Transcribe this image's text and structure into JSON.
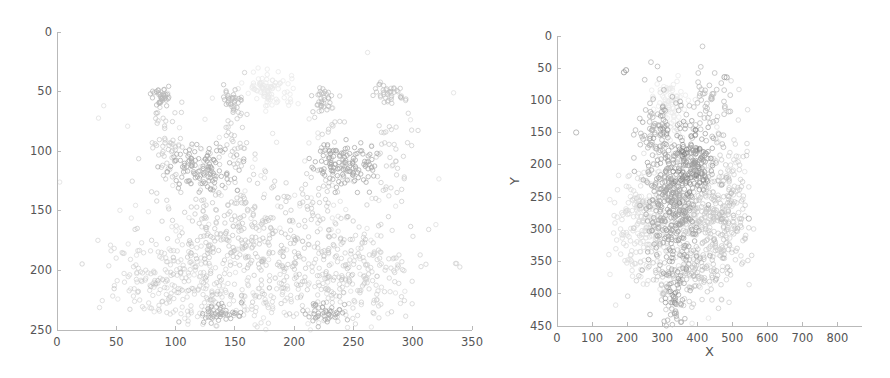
{
  "figure": {
    "background_color": "#ffffff",
    "axis_color": "#b9b9b9",
    "text_color": "#555555",
    "marker_shape": "circle-open"
  },
  "chart_data": [
    {
      "id": "left-panel",
      "type": "scatter",
      "title": "",
      "xlabel": "",
      "ylabel": "",
      "xlim": [
        0,
        350
      ],
      "ylim": [
        250,
        0
      ],
      "y_inverted": true,
      "grid": false,
      "legend": "none",
      "xticks": [
        0,
        50,
        100,
        150,
        200,
        250,
        300,
        350
      ],
      "xtick_labels": [
        "0",
        "50",
        "100",
        "150",
        "200",
        "250",
        "300",
        "350"
      ],
      "yticks": [
        0,
        50,
        100,
        150,
        200,
        250
      ],
      "ytick_labels": [
        "0",
        "50",
        "100",
        "150",
        "200",
        "250"
      ],
      "point_count": 2600,
      "clusters": [
        {
          "name": "dark-blob-left",
          "cx": 122,
          "cy": 113,
          "sx": 13,
          "sy": 9,
          "n": 210,
          "gray": "#6d6d6d",
          "alpha": 0.55,
          "r": 2.2
        },
        {
          "name": "dark-blob-right",
          "cx": 243,
          "cy": 112,
          "sx": 13,
          "sy": 9,
          "n": 210,
          "gray": "#666666",
          "alpha": 0.55,
          "r": 2.2
        },
        {
          "name": "light-top-cluster",
          "cx": 180,
          "cy": 49,
          "sx": 10,
          "sy": 7,
          "n": 150,
          "gray": "#d6d6d6",
          "alpha": 0.5,
          "r": 2.2
        },
        {
          "name": "spike-a-top",
          "cx": 88,
          "cy": 54,
          "sx": 4,
          "sy": 4,
          "n": 60,
          "gray": "#808080",
          "alpha": 0.55,
          "r": 2.2
        },
        {
          "name": "spike-b-top",
          "cx": 148,
          "cy": 57,
          "sx": 4,
          "sy": 5,
          "n": 55,
          "gray": "#8a8a8a",
          "alpha": 0.55,
          "r": 2.2
        },
        {
          "name": "spike-c-top",
          "cx": 224,
          "cy": 57,
          "sx": 5,
          "sy": 7,
          "n": 60,
          "gray": "#8f8f8f",
          "alpha": 0.55,
          "r": 2.2
        },
        {
          "name": "spike-d-top",
          "cx": 279,
          "cy": 51,
          "sx": 6,
          "sy": 5,
          "n": 55,
          "gray": "#949494",
          "alpha": 0.55,
          "r": 2.2
        },
        {
          "name": "spike-a-tail",
          "cx": 92,
          "cy": 95,
          "sx": 7,
          "sy": 25,
          "n": 90,
          "gray": "#9a9a9a",
          "alpha": 0.5,
          "r": 2.2
        },
        {
          "name": "spike-b-tail",
          "cx": 152,
          "cy": 95,
          "sx": 7,
          "sy": 25,
          "n": 75,
          "gray": "#9a9a9a",
          "alpha": 0.5,
          "r": 2.2
        },
        {
          "name": "spike-c-tail",
          "cx": 228,
          "cy": 95,
          "sx": 8,
          "sy": 26,
          "n": 80,
          "gray": "#9a9a9a",
          "alpha": 0.5,
          "r": 2.2
        },
        {
          "name": "spike-d-tail",
          "cx": 284,
          "cy": 95,
          "sx": 9,
          "sy": 28,
          "n": 80,
          "gray": "#9e9e9e",
          "alpha": 0.5,
          "r": 2.2
        },
        {
          "name": "center-dense-band",
          "cx": 168,
          "cy": 168,
          "sx": 42,
          "sy": 26,
          "n": 620,
          "gray": "#8d8d8d",
          "alpha": 0.45,
          "r": 2.2
        },
        {
          "name": "lower-left-lobe",
          "cx": 95,
          "cy": 205,
          "sx": 26,
          "sy": 19,
          "n": 330,
          "gray": "#a6a6a6",
          "alpha": 0.45,
          "r": 2.2
        },
        {
          "name": "lower-right-lobe",
          "cx": 255,
          "cy": 203,
          "sx": 27,
          "sy": 19,
          "n": 330,
          "gray": "#9d9d9d",
          "alpha": 0.45,
          "r": 2.2
        },
        {
          "name": "lower-center-band",
          "cx": 175,
          "cy": 220,
          "sx": 46,
          "sy": 16,
          "n": 300,
          "gray": "#a2a2a2",
          "alpha": 0.42,
          "r": 2.2
        },
        {
          "name": "bottom-dark-left",
          "cx": 137,
          "cy": 236,
          "sx": 9,
          "sy": 5,
          "n": 70,
          "gray": "#6f6f6f",
          "alpha": 0.55,
          "r": 2.2
        },
        {
          "name": "bottom-dark-right",
          "cx": 224,
          "cy": 236,
          "sx": 9,
          "sy": 5,
          "n": 70,
          "gray": "#6f6f6f",
          "alpha": 0.55,
          "r": 2.2
        },
        {
          "name": "sparse-halo",
          "cx": 175,
          "cy": 160,
          "sx": 70,
          "sy": 52,
          "n": 330,
          "gray": "#b0b0b0",
          "alpha": 0.4,
          "r": 2.2
        }
      ]
    },
    {
      "id": "right-panel",
      "type": "scatter",
      "title": "",
      "xlabel": "X",
      "ylabel": "Y",
      "xlim": [
        0,
        870
      ],
      "ylim": [
        450,
        0
      ],
      "y_inverted": true,
      "grid": false,
      "legend": "none",
      "xticks": [
        0,
        100,
        200,
        300,
        400,
        500,
        600,
        700,
        800
      ],
      "xtick_labels": [
        "0",
        "100",
        "200",
        "300",
        "400",
        "500",
        "600",
        "700",
        "800"
      ],
      "yticks": [
        0,
        50,
        100,
        150,
        200,
        250,
        300,
        350,
        400,
        450
      ],
      "ytick_labels": [
        "0",
        "50",
        "100",
        "150",
        "200",
        "250",
        "300",
        "350",
        "400",
        "450"
      ],
      "point_count": 2600,
      "clusters": [
        {
          "name": "core-dark-column",
          "cx": 330,
          "cy": 255,
          "sx": 36,
          "sy": 58,
          "n": 620,
          "gray": "#5e5e5e",
          "alpha": 0.55,
          "r": 2.3
        },
        {
          "name": "dark-upper-block",
          "cx": 390,
          "cy": 195,
          "sx": 26,
          "sy": 24,
          "n": 230,
          "gray": "#575757",
          "alpha": 0.55,
          "r": 2.3
        },
        {
          "name": "mid-gray-right",
          "cx": 430,
          "cy": 285,
          "sx": 48,
          "sy": 52,
          "n": 520,
          "gray": "#8e8e8e",
          "alpha": 0.45,
          "r": 2.3
        },
        {
          "name": "light-gray-left",
          "cx": 240,
          "cy": 300,
          "sx": 36,
          "sy": 45,
          "n": 370,
          "gray": "#b4b4b4",
          "alpha": 0.45,
          "r": 2.3
        },
        {
          "name": "light-top-cluster",
          "cx": 320,
          "cy": 105,
          "sx": 22,
          "sy": 18,
          "n": 140,
          "gray": "#d4d4d4",
          "alpha": 0.48,
          "r": 2.3
        },
        {
          "name": "upper-ring-arc",
          "cx": 290,
          "cy": 150,
          "sx": 30,
          "sy": 35,
          "n": 150,
          "gray": "#7a7a7a",
          "alpha": 0.55,
          "r": 2.4
        },
        {
          "name": "upper-right-ring",
          "cx": 430,
          "cy": 115,
          "sx": 32,
          "sy": 32,
          "n": 110,
          "gray": "#858585",
          "alpha": 0.55,
          "r": 2.4
        },
        {
          "name": "right-edge-scatter",
          "cx": 500,
          "cy": 255,
          "sx": 28,
          "sy": 60,
          "n": 180,
          "gray": "#a0a0a0",
          "alpha": 0.45,
          "r": 2.3
        },
        {
          "name": "lower-tail-column",
          "cx": 335,
          "cy": 415,
          "sx": 14,
          "sy": 22,
          "n": 95,
          "gray": "#6b6b6b",
          "alpha": 0.55,
          "r": 2.3
        },
        {
          "name": "bottom-spread",
          "cx": 370,
          "cy": 370,
          "sx": 55,
          "sy": 22,
          "n": 200,
          "gray": "#8a8a8a",
          "alpha": 0.45,
          "r": 2.3
        },
        {
          "name": "halo-outer",
          "cx": 360,
          "cy": 265,
          "sx": 78,
          "sy": 80,
          "n": 260,
          "gray": "#b8b8b8",
          "alpha": 0.4,
          "r": 2.3
        },
        {
          "name": "outlier-far-left",
          "cx": 50,
          "cy": 155,
          "sx": 3,
          "sy": 3,
          "n": 2,
          "gray": "#8a8a8a",
          "alpha": 0.75,
          "r": 2.6
        },
        {
          "name": "outlier-top-left",
          "cx": 195,
          "cy": 52,
          "sx": 4,
          "sy": 3,
          "n": 2,
          "gray": "#6f6f6f",
          "alpha": 0.75,
          "r": 2.6
        },
        {
          "name": "outlier-top-right",
          "cx": 480,
          "cy": 62,
          "sx": 6,
          "sy": 4,
          "n": 3,
          "gray": "#7a7a7a",
          "alpha": 0.75,
          "r": 2.6
        },
        {
          "name": "outlier-right-mid",
          "cx": 548,
          "cy": 285,
          "sx": 6,
          "sy": 6,
          "n": 3,
          "gray": "#8a8a8a",
          "alpha": 0.75,
          "r": 2.6
        }
      ]
    }
  ]
}
